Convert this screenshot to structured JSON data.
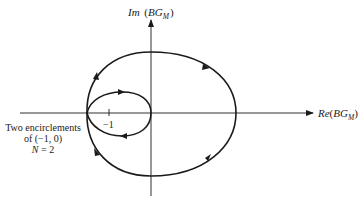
{
  "figure": {
    "type": "Nyquist plot",
    "y_axis_label": {
      "prefix": "Im",
      "paren_open": "(",
      "base": "BG",
      "sub": "M",
      "paren_close": ")"
    },
    "x_axis_label": {
      "prefix": "Re",
      "paren_open": "(",
      "base": "BG",
      "sub": "M",
      "paren_close": ")"
    },
    "tick_label": "−1",
    "annotation": {
      "line1": "Two encirclements",
      "line2": "of (−1, 0)",
      "line3_var": "N",
      "line3_rest": " = 2"
    },
    "colors": {
      "stroke": "#1a1a1a",
      "background": "#ffffff"
    }
  }
}
